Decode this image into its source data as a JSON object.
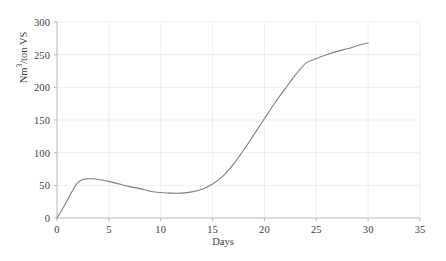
{
  "chart_data": {
    "type": "line",
    "title": "",
    "xlabel": "Days",
    "ylabel_prefix": "Nm",
    "ylabel_sup": "3",
    "ylabel_suffix": "/ton VS",
    "ylabel": "Nm3/ton VS",
    "xlim": [
      0,
      35
    ],
    "ylim": [
      0,
      300
    ],
    "xticks": [
      0,
      5,
      10,
      15,
      20,
      25,
      30,
      35
    ],
    "xtick_labels": [
      "0",
      "5",
      "10",
      "15",
      "20",
      "25",
      "30",
      "35"
    ],
    "yticks": [
      0,
      50,
      100,
      150,
      200,
      250,
      300
    ],
    "ytick_labels": [
      "0",
      "50",
      "100",
      "150",
      "200",
      "250",
      "300"
    ],
    "grid": true,
    "grid_color": "#ebebeb",
    "legend": null,
    "line_color": "#7f7f7f",
    "line_width": 1.1,
    "axis_color": "#b0b0b0",
    "background": "#ffffff",
    "series": [
      {
        "name": "Cumulative biogas yield",
        "x": [
          0,
          0.5,
          1,
          1.5,
          2,
          2.5,
          3,
          3.5,
          4,
          5,
          6,
          7,
          8,
          9,
          10,
          11,
          12,
          13,
          14,
          15,
          16,
          17,
          18,
          19,
          20,
          21,
          22,
          23,
          24,
          25,
          26,
          27,
          28,
          29,
          30
        ],
        "values": [
          0,
          13,
          27,
          42,
          54,
          59,
          60,
          60,
          59,
          56,
          52,
          48,
          45,
          41,
          39,
          38,
          38,
          40,
          44,
          52,
          64,
          82,
          104,
          128,
          152,
          176,
          198,
          219,
          237,
          244,
          250,
          255,
          259,
          264,
          268
        ]
      }
    ],
    "annotations": []
  }
}
